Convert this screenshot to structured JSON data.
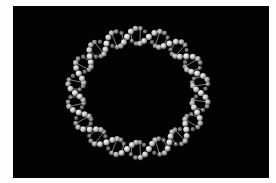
{
  "image": {
    "description": "Circular DNA double helix (plasmid) rendered as white spheres on black background",
    "caption": "Circular DNA",
    "background_color": "#030303",
    "frame_color": "#fdfdfd",
    "sphere_color": "#d9d9d9",
    "rung_color": "#9a9a9a"
  },
  "helix": {
    "center_x": 125,
    "center_y": 87,
    "radius_x": 63,
    "radius_y": 57,
    "amplitude": 8,
    "turns": 9,
    "spheres_per_strand": 90
  }
}
